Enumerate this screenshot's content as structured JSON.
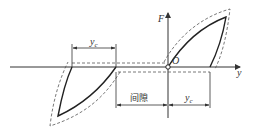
{
  "diagram": {
    "type": "force-displacement hysteresis with gap",
    "axes": {
      "horizontal_label": "y",
      "vertical_label": "F",
      "origin_label": "O"
    },
    "dimensions": {
      "top_left_label": "y",
      "top_left_sub": "c",
      "gap_label": "间隙",
      "bottom_right_label": "y",
      "bottom_right_sub": "c"
    },
    "colors": {
      "line": "#333333",
      "background": "#ffffff"
    }
  }
}
